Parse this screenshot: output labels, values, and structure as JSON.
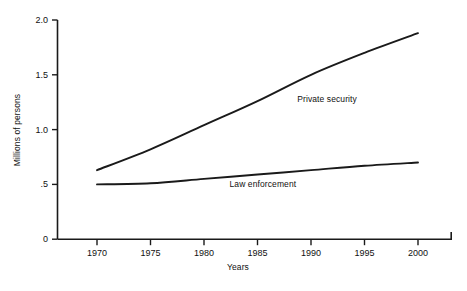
{
  "chart_data": {
    "type": "line",
    "title": "",
    "subtitle": "",
    "xlabel": "Years",
    "ylabel": "Millions of persons",
    "x": [
      1970,
      1975,
      1980,
      1985,
      1990,
      1995,
      2000
    ],
    "xtick_labels": [
      "1970",
      "1975",
      "1980",
      "1985",
      "1990",
      "1995",
      "2000"
    ],
    "ytick_labels": [
      "0",
      ".5",
      "1.0",
      "1.5",
      "2.0"
    ],
    "ytick_values": [
      0,
      0.5,
      1.0,
      1.5,
      2.0
    ],
    "xlim": [
      1968,
      2002
    ],
    "ylim": [
      0,
      2.0
    ],
    "grid": false,
    "legend": "inline-annotations",
    "series": [
      {
        "name": "Private security",
        "label": "Private security",
        "color": "#1a1a1a",
        "values": [
          0.63,
          0.82,
          1.04,
          1.26,
          1.5,
          1.7,
          1.88
        ]
      },
      {
        "name": "Law enforcement",
        "label": "Law enforcement",
        "color": "#1a1a1a",
        "values": [
          0.5,
          0.51,
          0.55,
          0.59,
          0.63,
          0.67,
          0.7
        ]
      }
    ],
    "annotations": [
      {
        "text": "Private security",
        "x": 1991.5,
        "y": 1.28
      },
      {
        "text": "Law enforcement",
        "x": 1985.5,
        "y": 0.5
      }
    ]
  },
  "axes": {
    "y_title": "Millions of persons",
    "x_title": "Years"
  }
}
